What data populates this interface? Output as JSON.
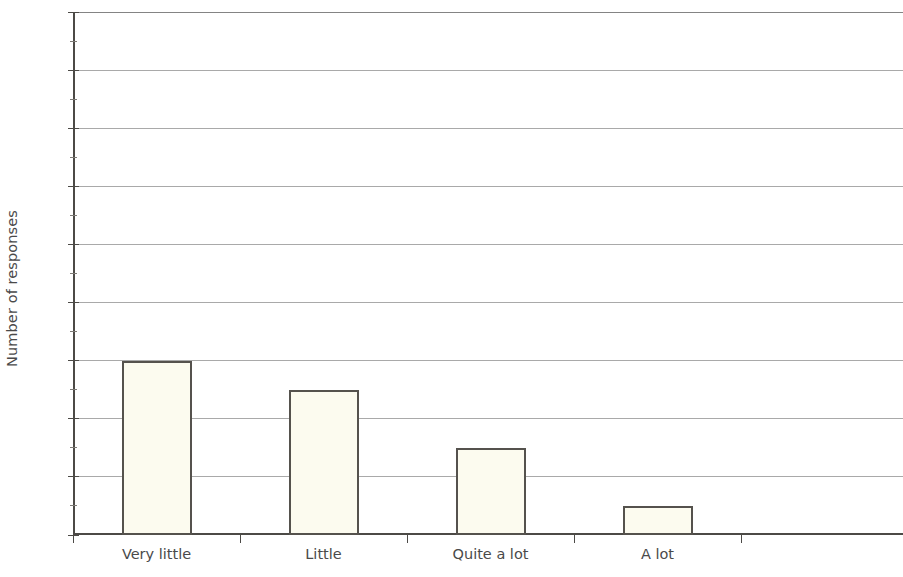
{
  "chart_data": {
    "type": "bar",
    "title": "",
    "subtitle": "",
    "xlabel": "",
    "ylabel": "Number of responses",
    "categories": [
      "Very little",
      "Little",
      "Quite a lot",
      "A lot"
    ],
    "values": [
      6,
      5,
      3,
      1
    ],
    "ylim": [
      0,
      18
    ],
    "ytick_step": 2,
    "yticks": [
      0,
      2,
      4,
      6,
      8,
      10,
      12,
      14,
      16,
      18
    ],
    "ytick_labels": [
      "0",
      "2",
      "4",
      "6",
      "8",
      "10",
      "12",
      "14",
      "16",
      "18"
    ],
    "minor_yticks": [
      1,
      3,
      5,
      7,
      9,
      11,
      13,
      15,
      17
    ],
    "grid": "horizontal",
    "legend": "none",
    "annotations": [],
    "bar_fill_color": "#fcfbef",
    "bar_border_color": "#55524d",
    "gridline_color": "#9a9a9a",
    "axis_color": "#4c4a46",
    "background_color": "#ffffff",
    "empty_trailing_slot": true,
    "slot_count": 5
  }
}
